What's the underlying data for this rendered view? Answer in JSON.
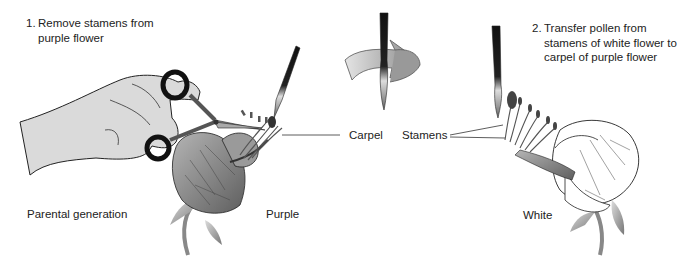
{
  "steps": [
    {
      "number": "1.",
      "lines": [
        "Remove stamens from",
        "purple flower"
      ]
    },
    {
      "number": "2.",
      "lines": [
        "Transfer pollen from",
        "stamens of white flower to",
        "carpel of purple flower"
      ]
    }
  ],
  "labels": {
    "carpel": "Carpel",
    "stamens": "Stamens",
    "parental_generation": "Parental generation",
    "purple": "Purple",
    "white": "White"
  },
  "colors": {
    "background": "#ffffff",
    "text": "#222222",
    "purple_petal": "#8a8a8a",
    "white_petal": "#ffffff",
    "outline": "#222222",
    "hand": "#d9d9d9",
    "arrow": "#a8a8a8"
  },
  "icons": [
    "scissors-icon",
    "hand-icon",
    "paintbrush-icon",
    "rotate-arrow-icon",
    "flower-icon"
  ]
}
